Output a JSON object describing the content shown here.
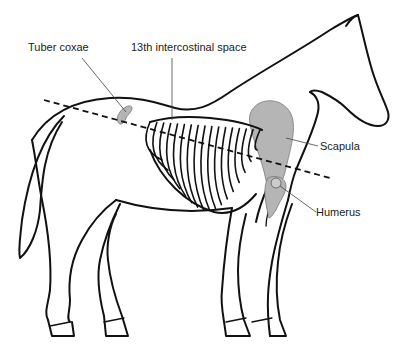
{
  "figure": {
    "colors": {
      "outline": "#111111",
      "bone_fill": "#b5b5b5",
      "leader_line": "#444444",
      "background": "#ffffff"
    },
    "labels": {
      "tuber_coxae": "Tuber coxae",
      "intercostal": "13th intercostinal space",
      "scapula": "Scapula",
      "humerus": "Humerus"
    },
    "rib_count": 17
  }
}
